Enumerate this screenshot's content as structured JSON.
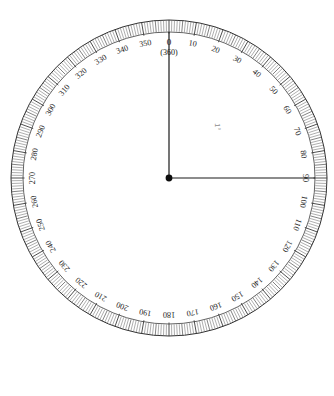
{
  "figure": {
    "type": "protractor-dial",
    "center": {
      "x": 169,
      "y": 178
    },
    "radius_outer": 158,
    "radius_inner": 146,
    "radius_label": 136,
    "background_color": "#ffffff",
    "line_color": "#1a1a1a",
    "tick_color_major": "#3a3a3a",
    "tick_color_minor": "#6a6a6a"
  },
  "scale": {
    "units": "degrees",
    "min": 0,
    "max": 360,
    "minor_step": 1,
    "mid_step": 5,
    "major_step": 10,
    "zero_position": "top",
    "direction": "clockwise",
    "labels": [
      "0",
      "10",
      "20",
      "30",
      "40",
      "50",
      "60",
      "70",
      "80",
      "90",
      "100",
      "110",
      "120",
      "130",
      "140",
      "150",
      "160",
      "170",
      "180",
      "190",
      "200",
      "210",
      "220",
      "230",
      "240",
      "250",
      "260",
      "270",
      "280",
      "290",
      "300",
      "310",
      "320",
      "330",
      "340",
      "350"
    ],
    "zero_label": "0",
    "zero_alt_label": "(360)"
  },
  "arms": [
    {
      "name": "reference-arm",
      "angle_deg": 0,
      "label": "0 / 360"
    },
    {
      "name": "measure-arm",
      "angle_deg": 90,
      "label": "90"
    }
  ],
  "center_marker": {
    "name": "vertex-dot",
    "radius": 3.4
  },
  "watermark": {
    "text": "1°",
    "x": 215,
    "y": 127,
    "rotation_deg": 90
  }
}
